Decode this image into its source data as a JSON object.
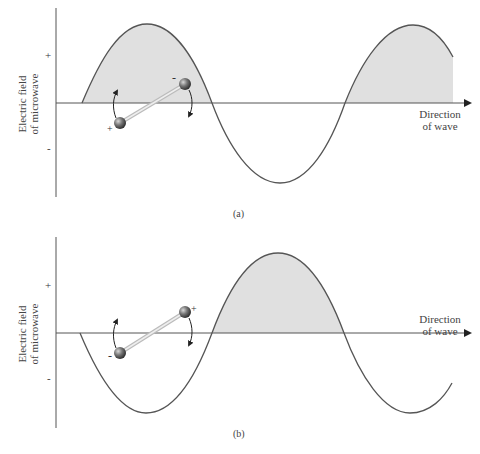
{
  "panels": [
    {
      "id": "a",
      "caption": "(a)",
      "y_axis_label_line1": "Electric field",
      "y_axis_label_line2": "of microwave",
      "plus_tick": "+",
      "minus_tick": "-",
      "direction_line1": "Direction",
      "direction_line2": "of wave",
      "dipole_left_charge": "+",
      "dipole_right_charge": "-",
      "shaded_regions": "positive half-cycles"
    },
    {
      "id": "b",
      "caption": "(b)",
      "y_axis_label_line1": "Electric field",
      "y_axis_label_line2": "of microwave",
      "plus_tick": "+",
      "minus_tick": "-",
      "direction_line1": "Direction",
      "direction_line2": "of wave",
      "dipole_left_charge": "-",
      "dipole_right_charge": "+",
      "shaded_regions": "positive half-cycle"
    }
  ],
  "colors": {
    "shade": "#e0e0e0",
    "curve": "#555555",
    "axis": "#555555",
    "ball": "#6a6a6a",
    "rod": "#c8c8c8"
  }
}
